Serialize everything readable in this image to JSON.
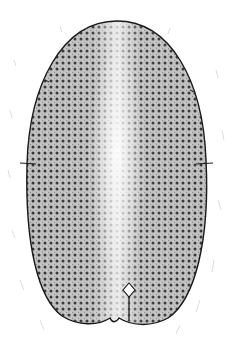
{
  "figure": {
    "colors": {
      "background": "#ffffff",
      "outline": "#1a1a1a",
      "stipple_dark": "#2a2a2a",
      "center_highlight": "#f2f2f2"
    },
    "shape": {
      "center_x": 117,
      "top_y": 20,
      "bottom_y": 325,
      "width": 188,
      "equator_y": 163
    },
    "features": [
      "dotted-pitted-surface",
      "light-central-band",
      "equatorial-suture",
      "basal-notch-with-diamond-hilum"
    ]
  }
}
